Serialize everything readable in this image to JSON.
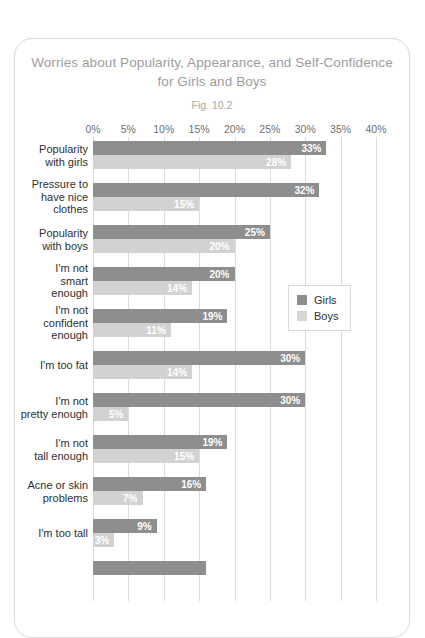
{
  "card": {
    "title_lines": [
      "Worries about Popularity, Appearance, and Self-Confidence",
      "for Girls and Boys"
    ],
    "figure_label": "Fig. 10.2"
  },
  "legend": {
    "position": "inside-right",
    "items": [
      {
        "label": "Girls",
        "color": "#8e8e8e"
      },
      {
        "label": "Boys",
        "color": "#d2d2d2"
      }
    ]
  },
  "axis": {
    "ticks": [
      "0%",
      "5%",
      "10%",
      "15%",
      "20%",
      "25%",
      "30%",
      "35%",
      "40%"
    ]
  },
  "chart_data": {
    "type": "bar",
    "orientation": "horizontal",
    "title": "Worries about Popularity, Appearance, and Self-Confidence for Girls and Boys",
    "subtitle": "Fig. 10.2",
    "xlabel": "",
    "ylabel": "",
    "xlim": [
      0,
      40
    ],
    "xticks": [
      0,
      5,
      10,
      15,
      20,
      25,
      30,
      35,
      40
    ],
    "xtick_labels": [
      "0%",
      "5%",
      "10%",
      "15%",
      "20%",
      "25%",
      "30%",
      "35%",
      "40%"
    ],
    "grid": true,
    "legend_position": "inside-right",
    "value_label_suffix": "%",
    "categories": [
      "Popularity with girls",
      "Pressure to have nice clothes",
      "Popularity with boys",
      "I'm not smart enough",
      "I'm not confident enough",
      "I'm too fat",
      "I'm not pretty enough",
      "I'm not tall enough",
      "Acne or skin problems",
      "I'm too tall"
    ],
    "category_label_lines": [
      [
        "Popularity",
        "with girls"
      ],
      [
        "Pressure to",
        "have nice",
        "clothes"
      ],
      [
        "Popularity",
        "with boys"
      ],
      [
        "I'm not",
        "smart",
        "enough"
      ],
      [
        "I'm not",
        "confident",
        "enough"
      ],
      [
        "I'm too fat"
      ],
      [
        "I'm not",
        "pretty enough"
      ],
      [
        "I'm not",
        "tall enough"
      ],
      [
        "Acne or skin",
        "problems"
      ],
      [
        "I'm too tall"
      ]
    ],
    "series": [
      {
        "name": "Girls",
        "color": "#8e8e8e",
        "values": [
          33,
          32,
          25,
          20,
          19,
          30,
          30,
          19,
          16,
          9
        ],
        "labels": [
          "33%",
          "32%",
          "25%",
          "20%",
          "19%",
          "30%",
          "30%",
          "19%",
          "16%",
          "9%"
        ]
      },
      {
        "name": "Boys",
        "color": "#d2d2d2",
        "values": [
          28,
          15,
          20,
          14,
          11,
          14,
          5,
          15,
          7,
          3
        ],
        "labels": [
          "28%",
          "15%",
          "20%",
          "14%",
          "11%",
          "14%",
          "5%",
          "15%",
          "7%",
          "3%"
        ]
      }
    ]
  }
}
